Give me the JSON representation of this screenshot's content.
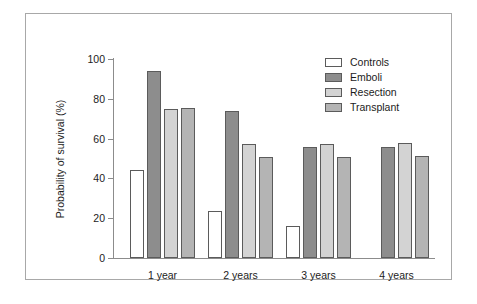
{
  "figure": {
    "frame_border_color": "#a8a8a8",
    "background": "#ffffff"
  },
  "chart_data": {
    "type": "bar",
    "title": "",
    "subtitle": "",
    "xlabel": "",
    "ylabel": "Probability of survival (%)",
    "categories": [
      "1 year",
      "2 years",
      "3 years",
      "4 years"
    ],
    "ylim": [
      0,
      100
    ],
    "yticks": [
      0,
      20,
      40,
      60,
      80,
      100
    ],
    "ytick_labels": [
      "0",
      "20",
      "40",
      "60",
      "80",
      "100"
    ],
    "grid": false,
    "legend_position": "top-right",
    "series": [
      {
        "name": "Controls",
        "color": "#ffffff",
        "edge_color": "#5b5b5b",
        "values": [
          44,
          23.5,
          16,
          null
        ]
      },
      {
        "name": "Emboli",
        "color": "#8d8d8d",
        "edge_color": "#5b5b5b",
        "values": [
          94,
          74,
          56,
          56
        ]
      },
      {
        "name": "Resection",
        "color": "#d3d3d3",
        "edge_color": "#5b5b5b",
        "values": [
          75,
          57.5,
          57.5,
          58
        ]
      },
      {
        "name": "Transplant",
        "color": "#b4b4b4",
        "edge_color": "#5b5b5b",
        "values": [
          75.5,
          51,
          51,
          51.5
        ]
      }
    ]
  },
  "legend": {
    "items": [
      {
        "label": "Controls",
        "color": "#ffffff"
      },
      {
        "label": "Emboli",
        "color": "#8d8d8d"
      },
      {
        "label": "Resection",
        "color": "#d3d3d3"
      },
      {
        "label": "Transplant",
        "color": "#b4b4b4"
      }
    ]
  }
}
